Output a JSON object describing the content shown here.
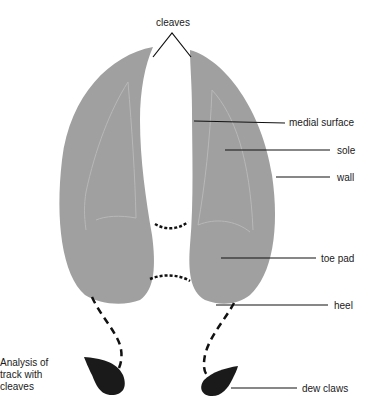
{
  "title": "Analysis of track with cleaves",
  "colors": {
    "hoof_fill": "#a0a0a0",
    "hoof_inner_line": "#b8b8b8",
    "dew_claw_fill": "#1a1a1a",
    "leader_line": "#111111"
  },
  "labels": {
    "cleaves": "cleaves",
    "medial_surface": "medial surface",
    "sole": "sole",
    "wall": "wall",
    "toe_pad": "toe pad",
    "heel": "heel",
    "dew_claws": "dew claws"
  },
  "caption": {
    "line1": "Analysis of",
    "line2": "track with",
    "line3": "cleaves"
  }
}
